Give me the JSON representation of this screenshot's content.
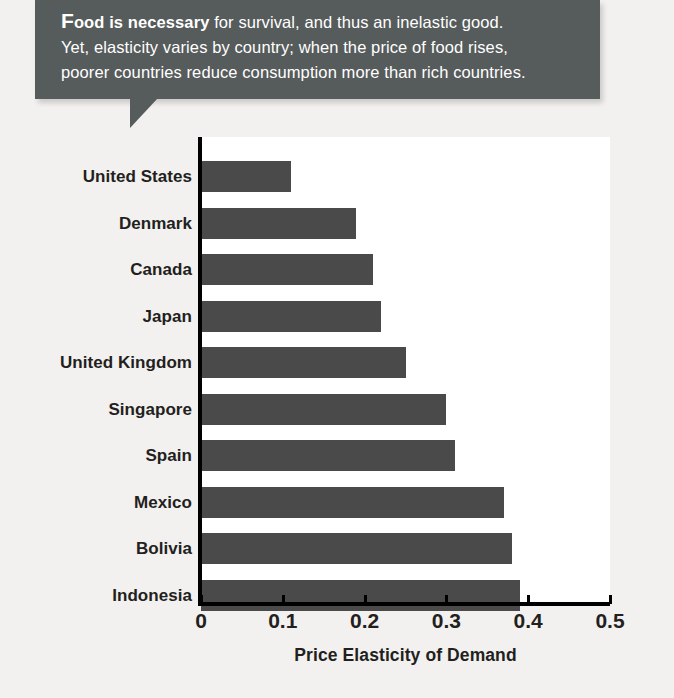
{
  "callout": {
    "lead_initial": "F",
    "lead_rest": "ood is necessary",
    "line1_rest": " for survival, and thus an inelastic good.",
    "line2": "Yet, elasticity varies by country; when the price of food rises,",
    "line3": "poorer countries reduce consumption more than rich countries.",
    "background": "#565b5b",
    "text_color": "#ffffff"
  },
  "chart_data": {
    "type": "bar",
    "orientation": "horizontal",
    "title": "",
    "xlabel": "Price Elasticity of Demand",
    "ylabel": "",
    "categories": [
      "United States",
      "Denmark",
      "Canada",
      "Japan",
      "United Kingdom",
      "Singapore",
      "Spain",
      "Mexico",
      "Bolivia",
      "Indonesia"
    ],
    "values": [
      0.11,
      0.19,
      0.21,
      0.22,
      0.25,
      0.3,
      0.31,
      0.37,
      0.38,
      0.39
    ],
    "xlim": [
      0,
      0.5
    ],
    "xticks": [
      0,
      0.1,
      0.2,
      0.3,
      0.4,
      0.5
    ],
    "xtick_labels": [
      "0",
      "0.1",
      "0.2",
      "0.3",
      "0.4",
      "0.5"
    ],
    "grid": false,
    "legend": false,
    "bar_color": "#4a4a4a",
    "plot_background": "#ffffff",
    "page_background": "#f2f1ef"
  }
}
